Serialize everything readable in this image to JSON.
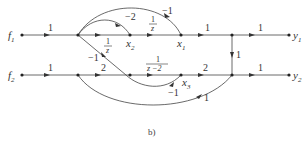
{
  "diagram": {
    "type": "signal-flow-graph",
    "caption": "b)",
    "nodes": {
      "f1": {
        "label": "f",
        "sub": "1"
      },
      "f2": {
        "label": "f",
        "sub": "2"
      },
      "x1": {
        "label": "x",
        "sub": "1"
      },
      "x2": {
        "label": "x",
        "sub": "2"
      },
      "x3": {
        "label": "x",
        "sub": "3"
      },
      "y1": {
        "label": "y",
        "sub": "1"
      },
      "y2": {
        "label": "y",
        "sub": "2"
      }
    },
    "edges": {
      "f1_a": "1",
      "a_x2": "1/z",
      "x2_x1": "1/z",
      "x1_out": "1",
      "out1_y1": "1",
      "x2_a_loop": "-2",
      "x1_a_loop": "-1",
      "a_x3_cross": "-1",
      "vertical": "1",
      "f2_b": "1",
      "b_c": "2",
      "c_x3": "1/(z-2)",
      "x3_out": "2",
      "out2_y2": "1",
      "x3_c_loop": "-1",
      "b_out2": "1"
    },
    "fractions": {
      "one_over_z_num": "1",
      "one_over_z_den": "z",
      "one_over_zm2_num": "1",
      "one_over_zm2_den": "z −2"
    },
    "gains": {
      "one": "1",
      "two": "2",
      "minus_one": "−1",
      "minus_two": "−2"
    }
  }
}
